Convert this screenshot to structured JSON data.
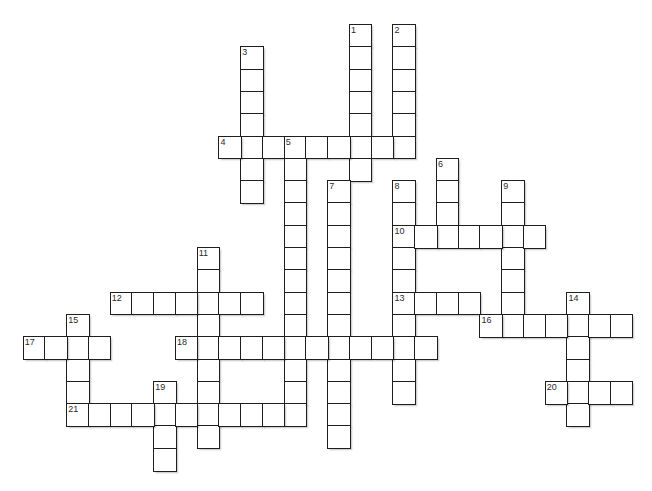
{
  "puzzle": {
    "type": "crossword",
    "grid": {
      "origin_x": 22.7,
      "origin_y": 24,
      "cell_w": 21.75,
      "cell_h": 22.3,
      "cols": 28,
      "rows": 20
    },
    "colors": {
      "border": "#1e1e1e",
      "cell_fill": "#ffffff",
      "background": "#ffffff",
      "number": "#2a2a2a"
    },
    "entries": [
      {
        "number": "1",
        "direction": "down",
        "row": 0,
        "col": 15,
        "length": 7
      },
      {
        "number": "2",
        "direction": "down",
        "row": 0,
        "col": 17,
        "length": 6
      },
      {
        "number": "3",
        "direction": "down",
        "row": 1,
        "col": 10,
        "length": 7
      },
      {
        "number": "4",
        "direction": "across",
        "row": 5,
        "col": 9,
        "length": 9
      },
      {
        "number": "5",
        "direction": "down",
        "row": 5,
        "col": 12,
        "length": 13
      },
      {
        "number": "6",
        "direction": "down",
        "row": 6,
        "col": 19,
        "length": 4
      },
      {
        "number": "7",
        "direction": "down",
        "row": 7,
        "col": 14,
        "length": 12
      },
      {
        "number": "8",
        "direction": "down",
        "row": 7,
        "col": 17,
        "length": 10
      },
      {
        "number": "9",
        "direction": "down",
        "row": 7,
        "col": 22,
        "length": 7
      },
      {
        "number": "10",
        "direction": "across",
        "row": 9,
        "col": 17,
        "length": 7
      },
      {
        "number": "11",
        "direction": "down",
        "row": 10,
        "col": 8,
        "length": 9
      },
      {
        "number": "12",
        "direction": "across",
        "row": 12,
        "col": 4,
        "length": 7
      },
      {
        "number": "13",
        "direction": "across",
        "row": 12,
        "col": 17,
        "length": 4
      },
      {
        "number": "14",
        "direction": "down",
        "row": 12,
        "col": 25,
        "length": 6
      },
      {
        "number": "15",
        "direction": "down",
        "row": 13,
        "col": 2,
        "length": 5
      },
      {
        "number": "16",
        "direction": "across",
        "row": 13,
        "col": 21,
        "length": 7
      },
      {
        "number": "17",
        "direction": "across",
        "row": 14,
        "col": 0,
        "length": 4
      },
      {
        "number": "18",
        "direction": "across",
        "row": 14,
        "col": 7,
        "length": 12
      },
      {
        "number": "19",
        "direction": "down",
        "row": 16,
        "col": 6,
        "length": 4
      },
      {
        "number": "20",
        "direction": "across",
        "row": 16,
        "col": 24,
        "length": 4
      },
      {
        "number": "21",
        "direction": "across",
        "row": 17,
        "col": 2,
        "length": 11
      }
    ]
  }
}
